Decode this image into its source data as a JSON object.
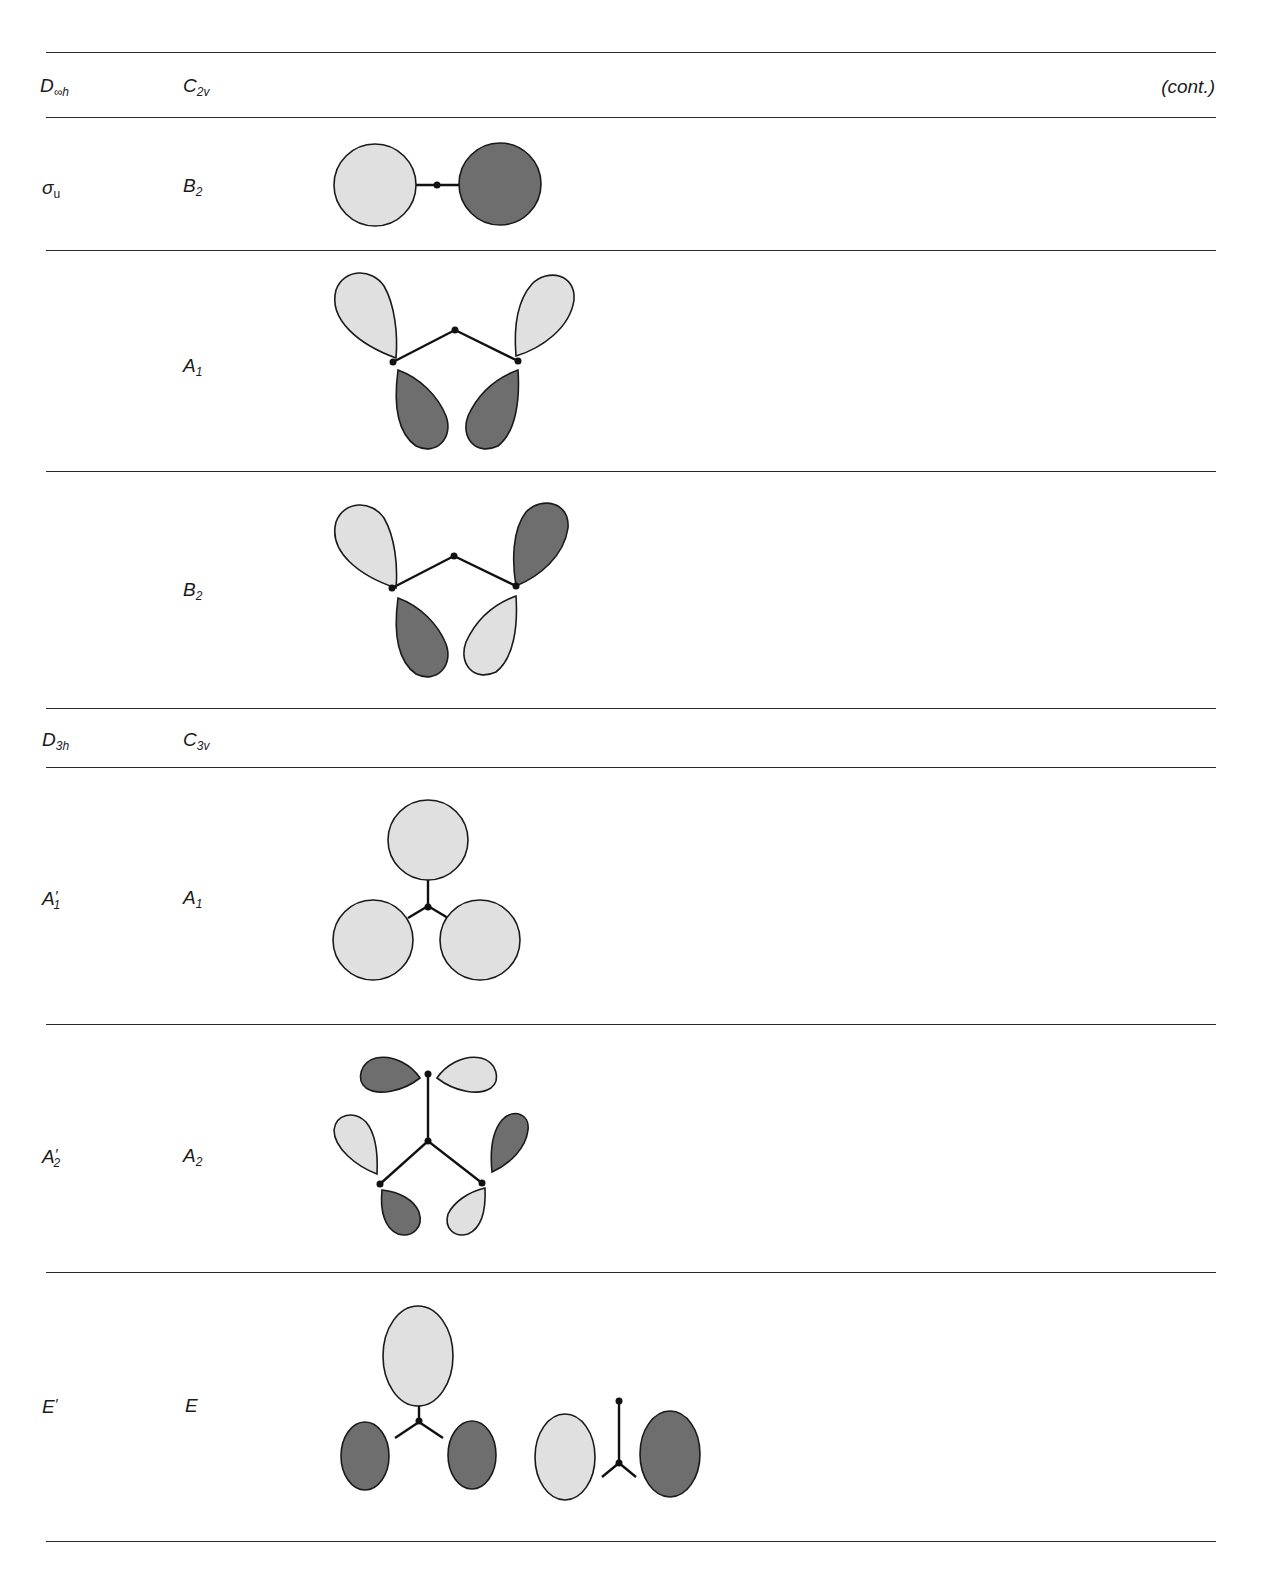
{
  "page": {
    "running_head": "",
    "continuation": "(cont.)"
  },
  "sections": [
    {
      "header": {
        "group_high": "D∞h",
        "group_high_base": "D",
        "group_high_sub": "∞h",
        "group_low_base": "C",
        "group_low_sub": "2v"
      },
      "rows": [
        {
          "high_label": "σu",
          "high_base": "σ",
          "high_sub": "u",
          "low_label": "B2",
          "low_base": "B",
          "low_sub": "2",
          "diagram": "linear two-center: light sphere left, dark sphere right"
        },
        {
          "high_label": "",
          "low_label": "A1",
          "low_base": "A",
          "low_sub": "1",
          "diagram": "bent triatomic: upper lobes light/light, lower lobes dark/dark"
        },
        {
          "high_label": "",
          "low_label": "B2",
          "low_base": "B",
          "low_sub": "2",
          "diagram": "bent triatomic: upper lobes light/dark, lower lobes dark/light"
        }
      ]
    },
    {
      "header": {
        "group_high": "D3h",
        "group_high_base": "D",
        "group_high_sub": "3h",
        "group_low_base": "C",
        "group_low_sub": "3v"
      },
      "rows": [
        {
          "high_label": "A′1",
          "high_base": "A",
          "high_prime": "′",
          "high_sub": "1",
          "low_label": "A1",
          "low_base": "A",
          "low_sub": "1",
          "diagram": "trigonal: three light spheres"
        },
        {
          "high_label": "A′2",
          "high_base": "A",
          "high_prime": "′",
          "high_sub": "2",
          "low_label": "A2",
          "low_base": "A",
          "low_sub": "2",
          "diagram": "trigonal: six tangential lobes alternating dark/light"
        },
        {
          "high_label": "E′",
          "high_base": "E",
          "high_prime": "′",
          "low_label": "E",
          "low_base": "E",
          "diagram": "two degenerate components: (light top, dark/dark bottom) and (light left, dark right)"
        }
      ]
    }
  ],
  "colors": {
    "light_lobe": "#e0e0e0",
    "dark_lobe": "#6e6e6e",
    "line": "#1a1a1a"
  }
}
